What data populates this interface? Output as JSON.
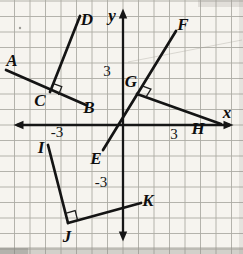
{
  "figure": {
    "canvas": {
      "width": 243,
      "height": 254
    },
    "colors": {
      "background": "#f6f4ef",
      "grid": "#adaba4",
      "ink": "#141414",
      "label_ink": "#0e0e0e"
    },
    "grid": {
      "spacing": 15.5,
      "center_x": 123,
      "center_y": 125
    },
    "axes": {
      "x_label": "x",
      "y_label": "y",
      "x_label_pos": {
        "x": 227,
        "y": 112
      },
      "y_label_pos": {
        "x": 112,
        "y": 15
      },
      "x_line": {
        "x1": 17,
        "x2": 230,
        "y": 125
      },
      "y_line": {
        "x": 123,
        "y1": 13,
        "y2": 237
      }
    },
    "tick_labels": [
      {
        "text": "3",
        "axis": "y",
        "x": 107,
        "y": 71
      },
      {
        "text": "-3",
        "axis": "x",
        "x": 57,
        "y": 132
      },
      {
        "text": "3",
        "axis": "x",
        "x": 174,
        "y": 134
      },
      {
        "text": "-3",
        "axis": "y",
        "x": 101,
        "y": 182
      }
    ],
    "segments": [
      {
        "name": "AB",
        "from": [
          6,
          70
        ],
        "to": [
          86,
          105
        ]
      },
      {
        "name": "DC",
        "from": [
          80,
          16
        ],
        "to": [
          50,
          92
        ]
      },
      {
        "name": "FE",
        "from": [
          176,
          31
        ],
        "to": [
          103,
          150
        ]
      },
      {
        "name": "GH",
        "from": [
          137,
          94
        ],
        "to": [
          221,
          124
        ]
      },
      {
        "name": "IJ",
        "from": [
          48,
          145
        ],
        "to": [
          68,
          223
        ]
      },
      {
        "name": "JK",
        "from": [
          68,
          223
        ],
        "to": [
          141,
          203
        ]
      }
    ],
    "right_angle_marks": [
      {
        "at": "C",
        "vertex": [
          50,
          92
        ],
        "arm1": [
          80,
          16
        ],
        "arm2": [
          86,
          105
        ],
        "size": 9
      },
      {
        "at": "G",
        "vertex": [
          137,
          94
        ],
        "arm1": [
          176,
          31
        ],
        "arm2": [
          221,
          124
        ],
        "size": 9.5
      },
      {
        "at": "J",
        "vertex": [
          68,
          223
        ],
        "arm1": [
          48,
          145
        ],
        "arm2": [
          141,
          203
        ],
        "size": 10
      }
    ],
    "point_labels": [
      {
        "text": "A",
        "x": 12,
        "y": 60
      },
      {
        "text": "B",
        "x": 89,
        "y": 107
      },
      {
        "text": "C",
        "x": 40,
        "y": 100
      },
      {
        "text": "D",
        "x": 87,
        "y": 19
      },
      {
        "text": "E",
        "x": 96,
        "y": 158
      },
      {
        "text": "F",
        "x": 183,
        "y": 24
      },
      {
        "text": "G",
        "x": 131,
        "y": 81
      },
      {
        "text": "H",
        "x": 198,
        "y": 128
      },
      {
        "text": "I",
        "x": 41,
        "y": 147
      },
      {
        "text": "J",
        "x": 67,
        "y": 236
      },
      {
        "text": "K",
        "x": 148,
        "y": 200
      }
    ]
  }
}
